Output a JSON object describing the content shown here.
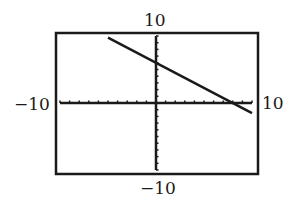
{
  "chart_data": {
    "type": "line",
    "title": "",
    "xlabel": "",
    "ylabel": "",
    "xlim": [
      -10,
      10
    ],
    "ylim": [
      -10,
      10
    ],
    "grid": false,
    "tick_spacing": 1,
    "window_labels": {
      "xmin": "−10",
      "xmax": "10",
      "ymin": "−10",
      "ymax": "10"
    },
    "series": [
      {
        "name": "line",
        "equation": "y = -0.75x + 6",
        "x": [
          -5,
          0,
          8,
          10
        ],
        "y": [
          9.75,
          6,
          0,
          -1.5
        ]
      }
    ],
    "colors": {
      "line": "#1a1a1a",
      "frame": "#1a1a1a"
    }
  }
}
